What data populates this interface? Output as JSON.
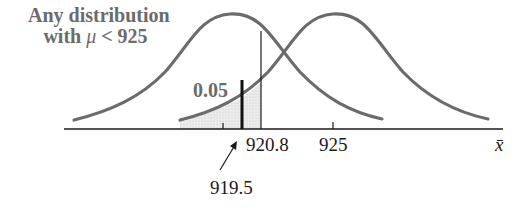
{
  "diagram": {
    "type": "hypothesis-test-normal-curves",
    "annotation": {
      "line1": "Any distribution",
      "line2_prefix": "with ",
      "line2_symbol": "μ",
      "line2_suffix": " < 925"
    },
    "alpha_label": "0.05",
    "critical_value_label": "920.8",
    "hypothesized_mean_label": "925",
    "observed_value_label": "919.5",
    "axis_label": "x̄",
    "colors": {
      "curve": "#6b6b6b",
      "shade": "#e3e3e3",
      "axis": "#1a1a1a",
      "text_gray": "#6b6b6b"
    }
  }
}
